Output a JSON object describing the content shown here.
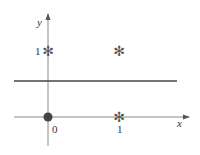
{
  "diagram": {
    "axes": {
      "x_label": "x",
      "y_label": "y",
      "x_ticks": [
        "0",
        "1"
      ],
      "y_ticks": [
        "1"
      ],
      "axis_color": "#888888"
    },
    "points": [
      {
        "x": 0,
        "y": 1,
        "marker": "asterisk"
      },
      {
        "x": 1,
        "y": 1,
        "marker": "asterisk"
      },
      {
        "x": 0,
        "y": 0,
        "marker": "filled-circle"
      },
      {
        "x": 1,
        "y": 0,
        "marker": "asterisk"
      }
    ],
    "separator_line": {
      "y": 0.5,
      "color": "#444444"
    },
    "marker_glyph": "✻",
    "colors": {
      "line": "#444444",
      "axis": "#888888",
      "circle": "#444444",
      "asterisk": "#555555"
    }
  }
}
